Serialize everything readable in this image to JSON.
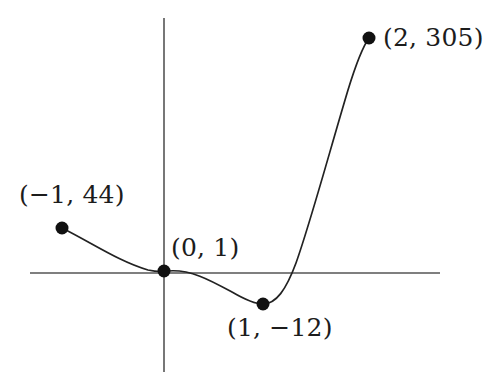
{
  "figure": {
    "background_color": "#ffffff",
    "width": 485,
    "height": 387
  },
  "axes": {
    "color": "#555555",
    "stroke_width": 1.6,
    "x_axis": {
      "name": "x-axis",
      "y_pixel": 273,
      "x_start": 30,
      "x_end": 440
    },
    "y_axis": {
      "name": "y-axis",
      "x_pixel": 164,
      "y_start": 18,
      "y_end": 372
    },
    "origin_pixel": {
      "x": 164,
      "y": 273
    },
    "tick_labels": [],
    "grid": false
  },
  "curve": {
    "name": "cubic-curve",
    "color": "#222222",
    "stroke_width": 1.7,
    "path": "M 62 228 C 92 243, 120 262, 148 270 C 157 272, 161 272, 168 271 C 190 269, 210 280, 232 292 C 244 299, 254 304, 263 304 C 276 304, 286 290, 296 263 C 310 224, 330 150, 348 90 C 356 64, 364 45, 369 38"
  },
  "points": [
    {
      "name": "point-neg1-44",
      "label": "(−1, 44)",
      "x_value": -1,
      "y_value": 44,
      "pixel": {
        "x": 62,
        "y": 228
      },
      "label_pixel": {
        "x": 19,
        "y": 182
      },
      "radius": 6.5
    },
    {
      "name": "point-0-1",
      "label": "(0, 1)",
      "x_value": 0,
      "y_value": 1,
      "pixel": {
        "x": 164,
        "y": 271
      },
      "label_pixel": {
        "x": 171,
        "y": 235
      },
      "radius": 6.5
    },
    {
      "name": "point-1-neg12",
      "label": "(1, −12)",
      "x_value": 1,
      "y_value": -12,
      "pixel": {
        "x": 263,
        "y": 304
      },
      "label_pixel": {
        "x": 227,
        "y": 315
      },
      "radius": 6.5
    },
    {
      "name": "point-2-305",
      "label": "(2, 305)",
      "x_value": 2,
      "y_value": 305,
      "pixel": {
        "x": 369,
        "y": 38
      },
      "label_pixel": {
        "x": 383,
        "y": 25
      },
      "radius": 6.5
    }
  ],
  "chart_data": {
    "type": "line",
    "title": "",
    "subtitle": "",
    "xlabel": "",
    "ylabel": "",
    "grid": false,
    "legend": null,
    "x": [
      -1,
      0,
      1,
      2
    ],
    "values": [
      44,
      1,
      -12,
      305
    ],
    "point_labels": [
      "(−1, 44)",
      "(0, 1)",
      "(1, −12)",
      "(2, 305)"
    ],
    "series": [
      {
        "name": "cubic",
        "x": [
          -1,
          0,
          1,
          2
        ],
        "values": [
          44,
          1,
          -12,
          305
        ]
      }
    ],
    "marked_points": [
      {
        "x": -1,
        "y": 44,
        "label": "(−1, 44)"
      },
      {
        "x": 0,
        "y": 1,
        "label": "(0, 1)"
      },
      {
        "x": 1,
        "y": -12,
        "label": "(1, −12)"
      },
      {
        "x": 2,
        "y": 305,
        "label": "(2, 305)"
      }
    ],
    "xlim": [
      -1.35,
      2.75
    ],
    "ylim": [
      -60,
      360
    ],
    "axis_crossings": {
      "x_intercept_visible_near": 1.35
    },
    "annotations": [
      "(−1, 44)",
      "(0, 1)",
      "(1, −12)",
      "(2, 305)"
    ]
  }
}
